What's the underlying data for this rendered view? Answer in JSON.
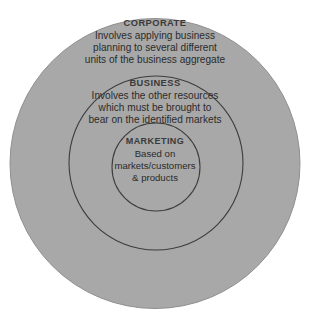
{
  "diagram": {
    "kind": "concentric-circles",
    "title_visible": false,
    "colors": {
      "background": "#ffffff",
      "ring_fill": "#a8a8a8",
      "ring_stroke": "#3d3d3d",
      "heading_text": "#3a3a3a",
      "body_text": "#2b2b2b"
    },
    "rings": [
      {
        "id": "corporate",
        "level": 1,
        "heading": "CORPORATE",
        "lines": [
          "Involves applying business",
          "planning to several different",
          "units of the business aggregate"
        ]
      },
      {
        "id": "business",
        "level": 2,
        "heading": "BUSINESS",
        "lines": [
          "Involves the other resources",
          "which must be brought to",
          "bear on the identified markets"
        ]
      },
      {
        "id": "marketing",
        "level": 3,
        "heading": "MARKETING",
        "lines": [
          "Based on",
          "markets/customers",
          "& products"
        ]
      }
    ]
  }
}
